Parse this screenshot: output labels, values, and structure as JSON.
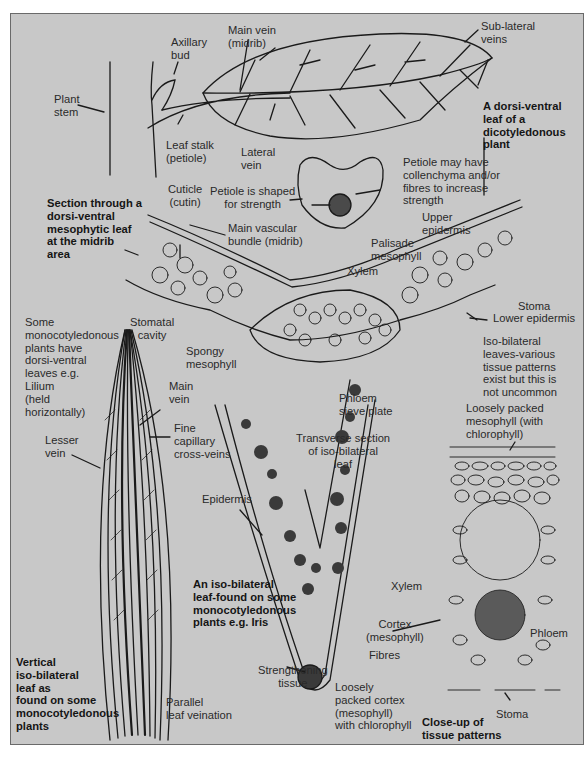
{
  "figure": {
    "background_color": "#c8c8c8",
    "ink_color": "#1a1a1a",
    "dark_fill_color": "#3a3a3a",
    "panels": {
      "dicot_leaf": {
        "title": "A dorsi-ventral\nleaf of a\ndicotyledonous\nplant",
        "labels": {
          "plant_stem": "Plant\nstem",
          "axillary_bud": "Axillary\nbud",
          "main_vein": "Main vein\n(midrib)",
          "sub_lateral_veins": "Sub-lateral\nveins",
          "leaf_stalk": "Leaf stalk\n(petiole)",
          "lateral_vein": "Lateral\nvein"
        }
      },
      "petiole_section": {
        "labels": {
          "petiole_shape": "Petiole is shaped\nfor strength",
          "petiole_collenchyma": "Petiole may have\ncollenchyma and/or\nfibres to increase\nstrength"
        }
      },
      "midrib_section": {
        "title": "Section through a\ndorsi-ventral\nmesophytic leaf\nat the midrib\narea",
        "labels": {
          "cuticle": "Cuticle\n(cutin)",
          "main_vascular_bundle": "Main vascular\nbundle (midrib)",
          "upper_epidermis": "Upper\nepidermis",
          "palisade_mesophyll": "Palisade\nmesophyll",
          "xylem": "Xylem",
          "stomatal_cavity": "Stomatal\ncavity",
          "stoma": "Stoma",
          "lower_epidermis": "Lower epidermis",
          "spongy_mesophyll": "Spongy\nmesophyll",
          "phloem_sieve_plate": "Phloem\nsieve plate"
        }
      },
      "monocot_leaf": {
        "title": "Vertical\niso-bilateral\nleaf as\nfound on some\nmonocotyledonous\nplants",
        "labels": {
          "lilium_note": "Some\nmonocotyledonous\nplants have\ndorsi-ventral\nleaves e.g.\nLilium\n(held\nhorizontally)",
          "main_vein": "Main\nvein",
          "lesser_vein": "Lesser\nvein",
          "fine_capillary": "Fine\ncapillary\ncross-veins",
          "parallel_veination": "Parallel\nleaf veination"
        }
      },
      "iso_bilateral_section": {
        "title": "An iso-bilateral\nleaf-found on some\nmonocotyledonous\nplants e.g. Iris",
        "labels": {
          "iso_note": "Iso-bilateral\nleaves-various\ntissue patterns\nexist but this is\nnot uncommon",
          "transverse_section": "Transverse section\nof iso-bilateral\nleaf",
          "epidermis": "Epidermis",
          "xylem": "Xylem",
          "cortex": "Cortex\n(mesophyll)",
          "fibres": "Fibres",
          "strengthening_tissue": "Strengthening\ntissue",
          "loosely_packed_cortex": "Loosely\npacked cortex\n(mesophyll)\nwith chlorophyll"
        }
      },
      "closeup": {
        "title": "Close-up of\ntissue patterns",
        "labels": {
          "loosely_packed_mesophyll": "Loosely packed\nmesophyll (with\nchlorophyll)",
          "phloem": "Phloem",
          "stoma": "Stoma"
        }
      }
    }
  }
}
